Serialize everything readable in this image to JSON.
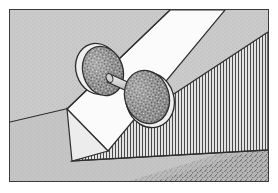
{
  "figure": {
    "title": "Dumbbell resting on an inclined plane",
    "caption": "",
    "frame_border_color": "#3a3a3a",
    "background_color": "#c9c9c9",
    "canvas": {
      "width": 278,
      "height": 193
    },
    "frame": {
      "x": 9,
      "y": 9,
      "width": 260,
      "height": 173
    }
  },
  "scene": {
    "background": {
      "name": "background-wall",
      "color": "#c9c9c9",
      "dither": true
    },
    "ground_line": {
      "name": "ground-horizon-line",
      "color": "#2e2e2e",
      "from": {
        "x": 0,
        "y": 112
      },
      "to": {
        "x": 58,
        "y": 99
      }
    },
    "floor": {
      "name": "floor-plane",
      "color": "#c4c4c4"
    },
    "shadow": {
      "name": "floor-shadow",
      "color": "#8c8c8c",
      "texture": "speckle"
    },
    "wedge": {
      "name": "hatched-support-wedge",
      "hatch_color": "#4a4a4a",
      "hatch_spacing_px": 3,
      "hatch_orientation": "vertical",
      "fill_color": "#d5d5d5",
      "edge_color": "#2e2e2e"
    },
    "plank": {
      "name": "inclined-plane-board",
      "face_color": "#fbfbfb",
      "side_color": "#e6e6e6",
      "edge_color": "#2e2e2e",
      "incline_direction": "up-to-the-right"
    },
    "dumbbell": {
      "name": "dumbbell",
      "disc_fill": "#8a8a8a",
      "disc_texture": "speckle",
      "disc_rim": "#f2f2f2",
      "disc_edge": "#2a2a2a",
      "bar_fill": "#bdbdbd",
      "bar_edge": "#2a2a2a",
      "discs": [
        {
          "name": "dumbbell-disc-rear",
          "cx": 92,
          "cy": 61,
          "rx": 22,
          "ry": 26
        },
        {
          "name": "dumbbell-disc-front",
          "cx": 138,
          "cy": 87,
          "rx": 24,
          "ry": 28
        }
      ],
      "bar": {
        "name": "dumbbell-bar",
        "x1": 102,
        "y1": 68,
        "x2": 133,
        "y2": 82
      }
    }
  },
  "colors": {
    "ink": "#2e2e2e",
    "paper": "#ffffff",
    "midtone": "#c9c9c9",
    "highlight": "#fbfbfb",
    "hatch": "#4a4a4a",
    "speckle": "#8a8a8a"
  }
}
